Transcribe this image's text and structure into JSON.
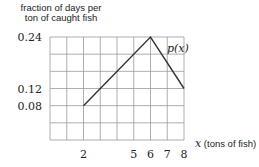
{
  "chart_data": {
    "type": "line",
    "title": "",
    "ylabel": "fraction of days per ton of caught fish",
    "ylabel_lines": [
      "fraction of days per",
      "ton of caught fish"
    ],
    "xlabel": "x (tons of fish)",
    "xlabel_var": "x",
    "xlabel_text": "(tons of fish)",
    "xlim": [
      0,
      8
    ],
    "ylim": [
      0,
      0.24
    ],
    "grid": true,
    "x_gridlines": [
      0,
      1,
      2,
      3,
      4,
      5,
      6,
      7,
      8
    ],
    "y_gridlines": [
      0,
      0.04,
      0.08,
      0.12,
      0.16,
      0.2,
      0.24
    ],
    "x_tick_labels": [
      "2",
      "5",
      "6",
      "7",
      "8"
    ],
    "x_ticks": [
      2,
      5,
      6,
      7,
      8
    ],
    "y_tick_labels": [
      "0.24",
      "0.12",
      "0.08"
    ],
    "y_ticks": [
      0.24,
      0.12,
      0.08
    ],
    "series": [
      {
        "name": "p(x)",
        "x": [
          2,
          6,
          8
        ],
        "y": [
          0.08,
          0.24,
          0.12
        ]
      }
    ],
    "annotations": [
      {
        "text": "p(x)",
        "x": 6.9,
        "y": 0.2
      }
    ]
  }
}
